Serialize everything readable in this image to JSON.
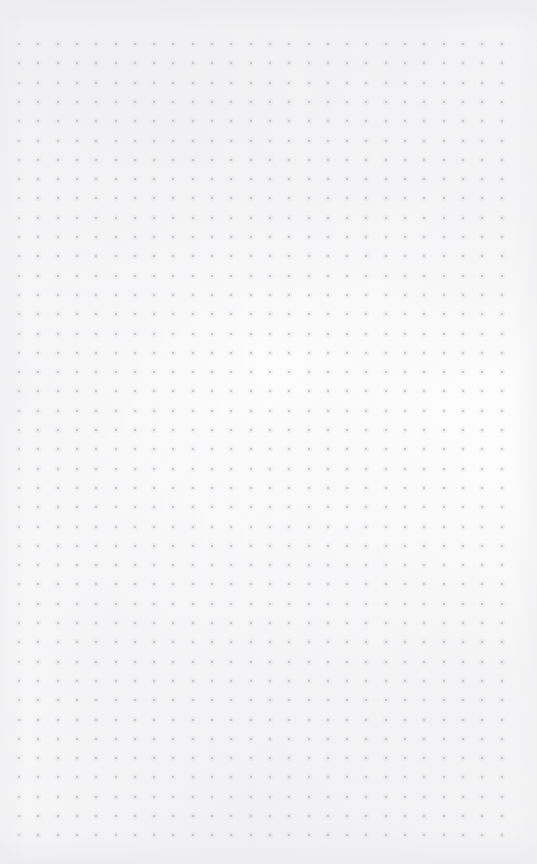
{
  "page": {
    "kind": "dot-grid-notebook-page",
    "width": 537,
    "height": 864,
    "paper_color": "#fdfdfd",
    "content_text": ""
  },
  "grid": {
    "dot_color": "#b9b9bd",
    "dot_size_px": 2,
    "spacing_px": 19.3,
    "origin_x_px": 19,
    "origin_y_px": 44,
    "columns": 26,
    "rows": 42,
    "margin_left_px": 19,
    "margin_right_px": 36,
    "margin_top_px": 44,
    "margin_bottom_px": 22
  },
  "annotations": {
    "notes": [],
    "handwriting": [],
    "headings": []
  }
}
